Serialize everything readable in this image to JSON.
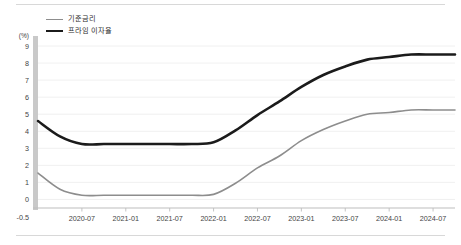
{
  "chart_data": {
    "type": "line",
    "title": "",
    "xlabel": "",
    "ylabel": "(%)",
    "grid": true,
    "legend_position": "top-left",
    "ylim": [
      -0.5,
      9
    ],
    "yticks": [
      -0.5,
      0,
      1,
      2,
      3,
      4,
      5,
      6,
      7,
      8,
      9
    ],
    "ytick_labels": [
      "-0.5",
      "0",
      "1",
      "2",
      "3",
      "4",
      "5",
      "6",
      "7",
      "8",
      "9"
    ],
    "x": [
      "2020-01",
      "2020-04",
      "2020-07",
      "2020-10",
      "2021-01",
      "2021-04",
      "2021-07",
      "2021-10",
      "2022-01",
      "2022-04",
      "2022-07",
      "2022-10",
      "2023-01",
      "2023-04",
      "2023-07",
      "2023-10",
      "2024-01",
      "2024-04",
      "2024-07",
      "2024-10"
    ],
    "xtick_labels": [
      "2020-07",
      "2021-01",
      "2021-07",
      "2022-01",
      "2022-07",
      "2023-01",
      "2023-07",
      "2024-01",
      "2024-07"
    ],
    "series": [
      {
        "name": "기준금리",
        "color": "#8d8d8d",
        "width": 1.6,
        "values": [
          1.55,
          0.6,
          0.25,
          0.25,
          0.25,
          0.25,
          0.25,
          0.25,
          0.3,
          0.95,
          1.85,
          2.55,
          3.45,
          4.1,
          4.6,
          5.0,
          5.1,
          5.25,
          5.25,
          5.25
        ]
      },
      {
        "name": "프라임 이자율",
        "color": "#1b1b1b",
        "width": 2.6,
        "values": [
          4.6,
          3.7,
          3.25,
          3.25,
          3.25,
          3.25,
          3.25,
          3.25,
          3.35,
          4.05,
          4.95,
          5.75,
          6.6,
          7.3,
          7.8,
          8.2,
          8.35,
          8.5,
          8.5,
          8.5
        ]
      }
    ]
  }
}
